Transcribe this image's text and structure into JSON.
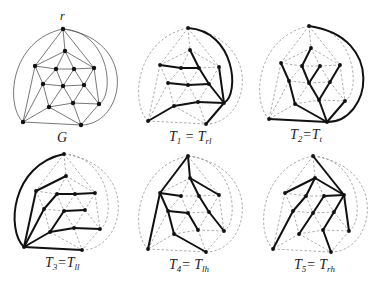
{
  "figure": {
    "root_label": "r",
    "graph_label": "G",
    "colors": {
      "graph_edge": "#555555",
      "tree_edge": "#111111",
      "dashed_edge": "#8a8a8a",
      "node": "#111111"
    },
    "nodes": {
      "r": [
        63,
        29
      ],
      "a": [
        65,
        51
      ],
      "b": [
        35,
        66
      ],
      "c": [
        56,
        69
      ],
      "d": [
        74,
        69
      ],
      "e": [
        94,
        68
      ],
      "f": [
        43,
        84
      ],
      "g": [
        63,
        86
      ],
      "h": [
        84,
        85
      ],
      "i": [
        49,
        107
      ],
      "j": [
        73,
        103
      ],
      "k": [
        99,
        104
      ],
      "BL": [
        23,
        122
      ],
      "BR": [
        81,
        125
      ]
    },
    "graph_edges": [
      [
        "r",
        "a"
      ],
      [
        "r",
        "b"
      ],
      [
        "r",
        "e"
      ],
      [
        "a",
        "b"
      ],
      [
        "a",
        "c"
      ],
      [
        "a",
        "d"
      ],
      [
        "a",
        "e"
      ],
      [
        "b",
        "c"
      ],
      [
        "c",
        "d"
      ],
      [
        "d",
        "e"
      ],
      [
        "b",
        "f"
      ],
      [
        "c",
        "f"
      ],
      [
        "c",
        "g"
      ],
      [
        "d",
        "g"
      ],
      [
        "d",
        "h"
      ],
      [
        "e",
        "h"
      ],
      [
        "e",
        "k"
      ],
      [
        "f",
        "g"
      ],
      [
        "g",
        "h"
      ],
      [
        "f",
        "i"
      ],
      [
        "g",
        "i"
      ],
      [
        "g",
        "j"
      ],
      [
        "h",
        "j"
      ],
      [
        "h",
        "k"
      ],
      [
        "i",
        "j"
      ],
      [
        "j",
        "k"
      ],
      [
        "b",
        "BL"
      ],
      [
        "f",
        "BL"
      ],
      [
        "i",
        "BL"
      ],
      [
        "i",
        "BR"
      ],
      [
        "j",
        "BR"
      ],
      [
        "k",
        "BR"
      ],
      [
        "BL",
        "BR"
      ]
    ],
    "outer_curves": {
      "r_BL": "M63,29 C10,40 5,105 23,122",
      "r_BR": "M63,29 C140,40 125,125 81,125",
      "r_k": "M63,29 C110,32 115,95 99,104"
    },
    "panels": [
      {
        "id": "G",
        "label_main": "G",
        "label_sub": "",
        "label_eq": "",
        "label_rhs": "",
        "label_rhs_sub": "",
        "offset": [
          0,
          0
        ],
        "tree_edges": [],
        "tree_curves": []
      },
      {
        "id": "T1",
        "label_main": "T",
        "label_sub": "1",
        "label_eq": " = ",
        "label_rhs": "T",
        "label_rhs_sub": "rl",
        "offset": [
          125,
          -1
        ],
        "tree_edges": [
          [
            "a",
            "d"
          ],
          [
            "d",
            "h"
          ],
          [
            "h",
            "k"
          ],
          [
            "b",
            "c"
          ],
          [
            "c",
            "d"
          ],
          [
            "e",
            "k"
          ],
          [
            "f",
            "g"
          ],
          [
            "g",
            "h"
          ],
          [
            "i",
            "j"
          ],
          [
            "j",
            "k"
          ],
          [
            "BL",
            "i"
          ],
          [
            "BR",
            "k"
          ]
        ],
        "tree_curves": [
          "r_k"
        ]
      },
      {
        "id": "T2",
        "label_main": "T",
        "label_sub": "2",
        "label_eq": "=",
        "label_rhs": "T",
        "label_rhs_sub": "t",
        "offset": [
          246,
          -3
        ],
        "tree_edges": [
          [
            "BL",
            "BR"
          ],
          [
            "BR",
            "i"
          ],
          [
            "i",
            "f"
          ],
          [
            "f",
            "b"
          ],
          [
            "BR",
            "j"
          ],
          [
            "j",
            "g"
          ],
          [
            "g",
            "c"
          ],
          [
            "c",
            "a"
          ],
          [
            "g",
            "d"
          ],
          [
            "j",
            "h"
          ],
          [
            "h",
            "e"
          ],
          [
            "BR",
            "k"
          ]
        ],
        "tree_curves": [
          "r_BR"
        ]
      },
      {
        "id": "T3",
        "label_main": "T",
        "label_sub": "3",
        "label_eq": "=",
        "label_rhs": "T",
        "label_rhs_sub": "ll",
        "offset": [
          1,
          125
        ],
        "tree_edges": [
          [
            "BL",
            "b"
          ],
          [
            "b",
            "a"
          ],
          [
            "BL",
            "f"
          ],
          [
            "f",
            "c"
          ],
          [
            "c",
            "d"
          ],
          [
            "d",
            "e"
          ],
          [
            "BL",
            "i"
          ],
          [
            "i",
            "g"
          ],
          [
            "g",
            "h"
          ],
          [
            "i",
            "j"
          ],
          [
            "j",
            "k"
          ],
          [
            "BL",
            "BR"
          ]
        ],
        "tree_curves": [
          "r_BL"
        ]
      },
      {
        "id": "T4",
        "label_main": "T",
        "label_sub": "4",
        "label_eq": "= ",
        "label_rhs": "T",
        "label_rhs_sub": "lh",
        "offset": [
          125,
          127
        ],
        "tree_edges": [
          [
            "r",
            "b"
          ],
          [
            "r",
            "a"
          ],
          [
            "a",
            "e"
          ],
          [
            "a",
            "d"
          ],
          [
            "d",
            "h"
          ],
          [
            "h",
            "k"
          ],
          [
            "b",
            "c"
          ],
          [
            "b",
            "f"
          ],
          [
            "f",
            "g"
          ],
          [
            "g",
            "j"
          ],
          [
            "f",
            "i"
          ],
          [
            "i",
            "BR"
          ],
          [
            "b",
            "BL"
          ]
        ],
        "tree_curves": []
      },
      {
        "id": "T5",
        "label_main": "T",
        "label_sub": "5",
        "label_eq": "= ",
        "label_rhs": "T",
        "label_rhs_sub": "rh",
        "offset": [
          250,
          127
        ],
        "tree_edges": [
          [
            "r",
            "e"
          ],
          [
            "e",
            "a"
          ],
          [
            "a",
            "b"
          ],
          [
            "a",
            "c"
          ],
          [
            "c",
            "f"
          ],
          [
            "f",
            "BL"
          ],
          [
            "e",
            "d"
          ],
          [
            "d",
            "g"
          ],
          [
            "g",
            "i"
          ],
          [
            "e",
            "h"
          ],
          [
            "h",
            "j"
          ],
          [
            "j",
            "BR"
          ],
          [
            "e",
            "k"
          ]
        ],
        "tree_curves": []
      }
    ]
  }
}
